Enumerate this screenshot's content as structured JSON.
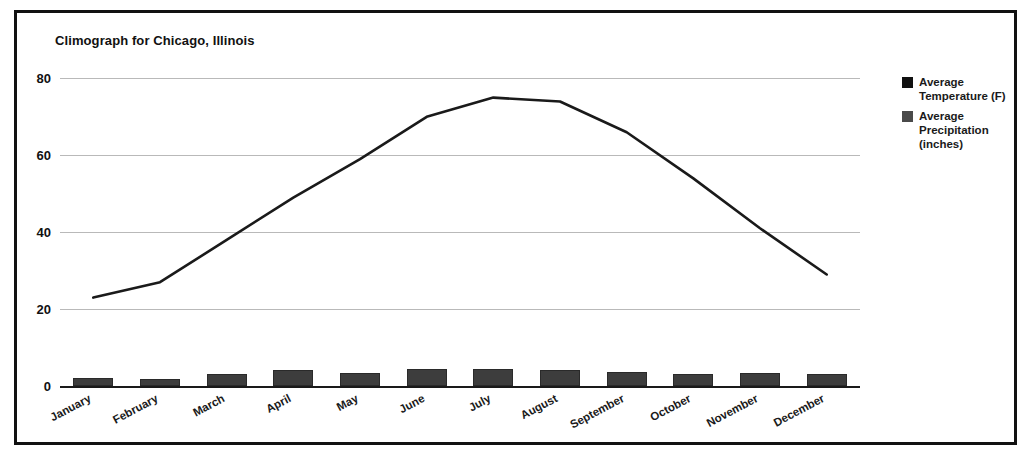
{
  "chart_data": {
    "type": "bar",
    "title": "Climograph for Chicago, Illinois",
    "xlabel": "",
    "ylabel": "",
    "ylim": [
      0,
      84
    ],
    "yticks": [
      0,
      20,
      40,
      60,
      80
    ],
    "grid": true,
    "legend_position": "right",
    "categories": [
      "January",
      "February",
      "March",
      "April",
      "May",
      "June",
      "July",
      "August",
      "September",
      "October",
      "November",
      "December"
    ],
    "series": [
      {
        "name": "Average Temperature (F)",
        "type": "line",
        "color": "#1a1a1a",
        "values": [
          23,
          27,
          38,
          49,
          59,
          70,
          75,
          74,
          66,
          54,
          41,
          29
        ]
      },
      {
        "name": "Average Precipitation (inches)",
        "type": "bar",
        "color": "#3d3d3d",
        "values": [
          2.0,
          1.9,
          3.0,
          4.2,
          3.5,
          4.5,
          4.5,
          4.2,
          3.7,
          3.2,
          3.4,
          3.1
        ]
      }
    ]
  },
  "legend": {
    "entries": [
      {
        "label": "Average Temperature (F)",
        "color": "#111111",
        "swatch": "legend-swatch-temperature"
      },
      {
        "label": "Average Precipitation (inches)",
        "color": "#4a4a4a",
        "swatch": "legend-swatch-precipitation"
      }
    ]
  },
  "colors": {
    "frame_border": "#111111",
    "background": "#ffffff",
    "gridline": "#b9b9b9",
    "axis": "#1a1a1a",
    "temperature_line": "#1a1a1a",
    "precipitation_bar": "#3d3d3d"
  }
}
